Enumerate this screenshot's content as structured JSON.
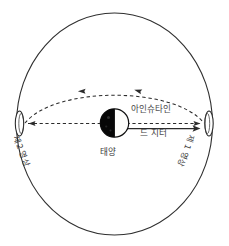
{
  "diagram": {
    "colors": {
      "stroke": "#2f2f2f",
      "background": "#ffffff",
      "sun_dark": "#050505",
      "sun_light": "#fdfdfb",
      "text": "#3a3a3a"
    },
    "labels": {
      "einstein": "아인슈타인",
      "de_sitter": "드 지터",
      "sun": "태양",
      "image_second": "제2 영상",
      "image_first": "제 1 영상"
    },
    "elements": {
      "universe_circle": "universe-boundary-circle",
      "sun_body": "sun-half-lit-disc",
      "left_marker": "left-image-ellipse",
      "right_marker": "right-image-ellipse",
      "straight_path": "einstein-straight-light-path",
      "curved_path": "de-sitter-curved-light-path",
      "solid_arrow": "de-sitter-solid-arrow"
    }
  }
}
